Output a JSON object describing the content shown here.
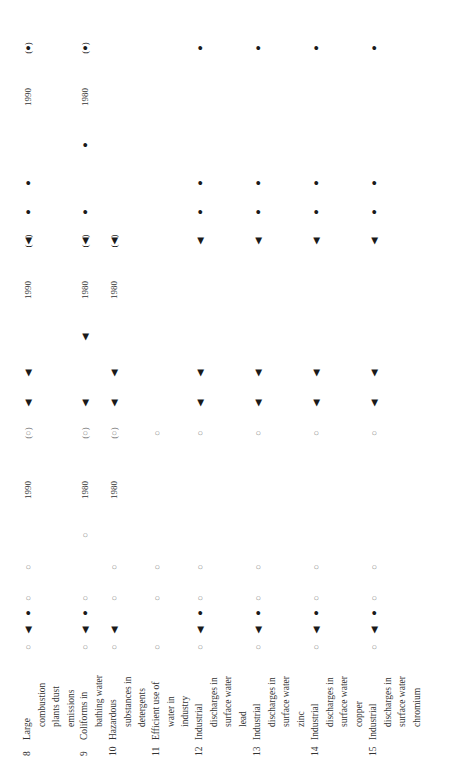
{
  "table": {
    "orientation": "rotated-90-ccw",
    "symbols": {
      "open_circle": "○",
      "triangle": "◀",
      "dot": "●",
      "bracket_circle": "(○)",
      "bracket_triangle": "(◀)",
      "bracket_dot": "(●)"
    },
    "rows": [
      {
        "number": "8",
        "label_lines": [
          "Large",
          "combustion",
          "plants dust",
          "emissions"
        ],
        "x": 28,
        "cells": [
          {
            "y": 647,
            "type": "open",
            "text": "○"
          },
          {
            "y": 630,
            "type": "solid",
            "text": "◀"
          },
          {
            "y": 613,
            "type": "solid",
            "text": "●"
          },
          {
            "y": 598,
            "type": "open",
            "text": "○"
          },
          {
            "y": 567,
            "type": "open",
            "text": "○"
          },
          {
            "y": 490,
            "type": "year",
            "text": "1990"
          },
          {
            "y": 433,
            "type": "open",
            "text": "(○)"
          },
          {
            "y": 403,
            "type": "solid",
            "text": "◀"
          },
          {
            "y": 373,
            "type": "solid",
            "text": "◀"
          },
          {
            "y": 290,
            "type": "year",
            "text": "1990"
          },
          {
            "y": 241,
            "type": "solid",
            "text": "(◀)"
          },
          {
            "y": 212,
            "type": "solid",
            "text": "●"
          },
          {
            "y": 183,
            "type": "solid",
            "text": "●"
          },
          {
            "y": 97,
            "type": "year",
            "text": "1990"
          },
          {
            "y": 48,
            "type": "solid",
            "text": "(●)"
          }
        ]
      },
      {
        "number": "9",
        "label_lines": [
          "Coliforms in",
          "bathing water"
        ],
        "x": 85,
        "cells": [
          {
            "y": 647,
            "type": "open",
            "text": "○"
          },
          {
            "y": 630,
            "type": "solid",
            "text": "◀"
          },
          {
            "y": 613,
            "type": "solid",
            "text": "●"
          },
          {
            "y": 598,
            "type": "open",
            "text": "○"
          },
          {
            "y": 535,
            "type": "open",
            "text": "○"
          },
          {
            "y": 490,
            "type": "year",
            "text": "1980"
          },
          {
            "y": 433,
            "type": "open",
            "text": "(○)"
          },
          {
            "y": 403,
            "type": "solid",
            "text": "◀"
          },
          {
            "y": 337,
            "type": "solid",
            "text": "◀"
          },
          {
            "y": 290,
            "type": "year",
            "text": "1980"
          },
          {
            "y": 241,
            "type": "solid",
            "text": "(◀)"
          },
          {
            "y": 212,
            "type": "solid",
            "text": "●"
          },
          {
            "y": 145,
            "type": "solid",
            "text": "●"
          },
          {
            "y": 97,
            "type": "year",
            "text": "1980"
          },
          {
            "y": 48,
            "type": "solid",
            "text": "(●)"
          }
        ]
      },
      {
        "number": "10",
        "label_lines": [
          "Hazardous",
          "substances in",
          "detergents"
        ],
        "x": 114,
        "cells": [
          {
            "y": 647,
            "type": "open",
            "text": "○"
          },
          {
            "y": 630,
            "type": "solid",
            "text": "◀"
          },
          {
            "y": 598,
            "type": "open",
            "text": "○"
          },
          {
            "y": 567,
            "type": "open",
            "text": "○"
          },
          {
            "y": 490,
            "type": "year",
            "text": "1980"
          },
          {
            "y": 433,
            "type": "open",
            "text": "(○)"
          },
          {
            "y": 403,
            "type": "solid",
            "text": "◀"
          },
          {
            "y": 373,
            "type": "solid",
            "text": "◀"
          },
          {
            "y": 290,
            "type": "year",
            "text": "1980"
          },
          {
            "y": 241,
            "type": "solid",
            "text": "(◀)"
          }
        ]
      },
      {
        "number": "11",
        "label_lines": [
          "Efficient use of",
          "water in",
          "industry"
        ],
        "x": 157,
        "cells": [
          {
            "y": 647,
            "type": "open",
            "text": "○"
          },
          {
            "y": 598,
            "type": "open",
            "text": "○"
          },
          {
            "y": 567,
            "type": "open",
            "text": "○"
          },
          {
            "y": 433,
            "type": "open",
            "text": "○"
          }
        ]
      },
      {
        "number": "12",
        "label_lines": [
          "Industrial",
          "discharges in",
          "surface water",
          "lead"
        ],
        "x": 200,
        "cells": [
          {
            "y": 647,
            "type": "open",
            "text": "○"
          },
          {
            "y": 630,
            "type": "solid",
            "text": "◀"
          },
          {
            "y": 613,
            "type": "solid",
            "text": "●"
          },
          {
            "y": 598,
            "type": "open",
            "text": "○"
          },
          {
            "y": 567,
            "type": "open",
            "text": "○"
          },
          {
            "y": 433,
            "type": "open",
            "text": "○"
          },
          {
            "y": 403,
            "type": "solid",
            "text": "◀"
          },
          {
            "y": 373,
            "type": "solid",
            "text": "◀"
          },
          {
            "y": 241,
            "type": "solid",
            "text": "◀"
          },
          {
            "y": 212,
            "type": "solid",
            "text": "●"
          },
          {
            "y": 183,
            "type": "solid",
            "text": "●"
          },
          {
            "y": 48,
            "type": "solid",
            "text": "●"
          }
        ]
      },
      {
        "number": "13",
        "label_lines": [
          "Industrial",
          "discharges in",
          "surface water",
          "zinc"
        ],
        "x": 258,
        "cells": [
          {
            "y": 647,
            "type": "open",
            "text": "○"
          },
          {
            "y": 630,
            "type": "solid",
            "text": "◀"
          },
          {
            "y": 613,
            "type": "solid",
            "text": "●"
          },
          {
            "y": 598,
            "type": "open",
            "text": "○"
          },
          {
            "y": 567,
            "type": "open",
            "text": "○"
          },
          {
            "y": 433,
            "type": "open",
            "text": "○"
          },
          {
            "y": 403,
            "type": "solid",
            "text": "◀"
          },
          {
            "y": 373,
            "type": "solid",
            "text": "◀"
          },
          {
            "y": 241,
            "type": "solid",
            "text": "◀"
          },
          {
            "y": 212,
            "type": "solid",
            "text": "●"
          },
          {
            "y": 183,
            "type": "solid",
            "text": "●"
          },
          {
            "y": 48,
            "type": "solid",
            "text": "●"
          }
        ]
      },
      {
        "number": "14",
        "label_lines": [
          "Industrial",
          "discharges in",
          "surface water",
          "copper"
        ],
        "x": 316,
        "cells": [
          {
            "y": 647,
            "type": "open",
            "text": "○"
          },
          {
            "y": 630,
            "type": "solid",
            "text": "◀"
          },
          {
            "y": 613,
            "type": "solid",
            "text": "●"
          },
          {
            "y": 598,
            "type": "open",
            "text": "○"
          },
          {
            "y": 567,
            "type": "open",
            "text": "○"
          },
          {
            "y": 433,
            "type": "open",
            "text": "○"
          },
          {
            "y": 403,
            "type": "solid",
            "text": "◀"
          },
          {
            "y": 373,
            "type": "solid",
            "text": "◀"
          },
          {
            "y": 241,
            "type": "solid",
            "text": "◀"
          },
          {
            "y": 212,
            "type": "solid",
            "text": "●"
          },
          {
            "y": 183,
            "type": "solid",
            "text": "●"
          },
          {
            "y": 48,
            "type": "solid",
            "text": "●"
          }
        ]
      },
      {
        "number": "15",
        "label_lines": [
          "Industrial",
          "discharges in",
          "surface water",
          "chromium"
        ],
        "x": 374,
        "cells": [
          {
            "y": 647,
            "type": "open",
            "text": "○"
          },
          {
            "y": 630,
            "type": "solid",
            "text": "◀"
          },
          {
            "y": 613,
            "type": "solid",
            "text": "●"
          },
          {
            "y": 598,
            "type": "open",
            "text": "○"
          },
          {
            "y": 567,
            "type": "open",
            "text": "○"
          },
          {
            "y": 433,
            "type": "open",
            "text": "○"
          },
          {
            "y": 403,
            "type": "solid",
            "text": "◀"
          },
          {
            "y": 373,
            "type": "solid",
            "text": "◀"
          },
          {
            "y": 241,
            "type": "solid",
            "text": "◀"
          },
          {
            "y": 212,
            "type": "solid",
            "text": "●"
          },
          {
            "y": 183,
            "type": "solid",
            "text": "●"
          },
          {
            "y": 48,
            "type": "solid",
            "text": "●"
          }
        ]
      }
    ]
  }
}
